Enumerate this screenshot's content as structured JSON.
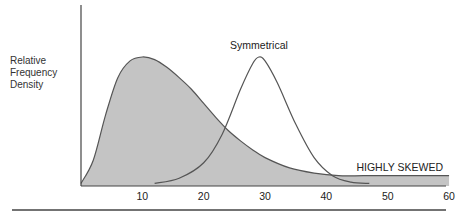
{
  "chart_data": {
    "type": "area",
    "title": "",
    "xlabel": "",
    "ylabel": "Relative Frequency Density",
    "ylabel_lines": [
      "Relative",
      "Frequency",
      "Density"
    ],
    "xlim": [
      0,
      60
    ],
    "xticks": [
      10,
      20,
      30,
      40,
      50,
      60
    ],
    "grid": false,
    "legend": "none",
    "annotations": [
      {
        "text": "Symmetrical",
        "x": 29,
        "position": "above peak"
      },
      {
        "text": "HIGHLY SKEWED",
        "x": 50,
        "position": "above right tail"
      }
    ],
    "series": [
      {
        "name": "HIGHLY SKEWED",
        "style": "filled gray area",
        "fill": "#c4c4c4",
        "x": [
          0,
          2,
          4,
          6,
          8,
          10,
          12,
          14,
          16,
          18,
          20,
          22,
          24,
          26,
          28,
          30,
          34,
          38,
          42,
          46,
          50,
          55,
          60
        ],
        "values": [
          0.02,
          0.2,
          0.55,
          0.84,
          0.97,
          1.0,
          0.98,
          0.92,
          0.84,
          0.75,
          0.64,
          0.53,
          0.43,
          0.35,
          0.28,
          0.22,
          0.14,
          0.1,
          0.08,
          0.08,
          0.08,
          0.08,
          0.08
        ]
      },
      {
        "name": "Symmetrical",
        "style": "line",
        "x": [
          12,
          16,
          20,
          23,
          26,
          28,
          29,
          30,
          32,
          35,
          38,
          41,
          44,
          47
        ],
        "values": [
          0.02,
          0.06,
          0.18,
          0.4,
          0.75,
          0.95,
          1.0,
          0.97,
          0.8,
          0.48,
          0.22,
          0.08,
          0.03,
          0.02
        ]
      }
    ]
  },
  "labels": {
    "ylabel_lines": [
      "Relative",
      "Frequency",
      "Density"
    ],
    "symmetrical": "Symmetrical",
    "skewed": "HIGHLY SKEWED",
    "ticks": [
      "10",
      "20",
      "30",
      "40",
      "50",
      "60"
    ]
  }
}
